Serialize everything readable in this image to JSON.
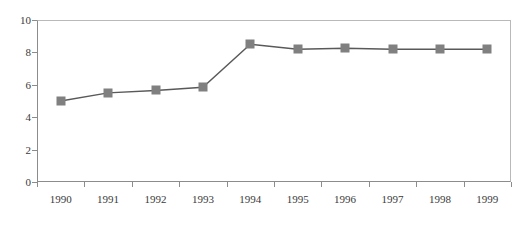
{
  "chart_data": {
    "type": "line",
    "title": "",
    "xlabel": "",
    "ylabel": "",
    "categories": [
      "1990",
      "1991",
      "1992",
      "1993",
      "1994",
      "1995",
      "1996",
      "1997",
      "1998",
      "1999"
    ],
    "values": [
      5.0,
      5.5,
      5.65,
      5.85,
      8.5,
      8.2,
      8.25,
      8.2,
      8.2,
      8.2
    ],
    "series": [
      {
        "name": "series-1",
        "values": [
          5.0,
          5.5,
          5.65,
          5.85,
          8.5,
          8.2,
          8.25,
          8.2,
          8.2,
          8.2
        ]
      }
    ],
    "ylim": [
      0,
      10
    ],
    "ytick_values": [
      0,
      2,
      4,
      6,
      8,
      10
    ],
    "ytick_labels": [
      "0",
      "2",
      "4",
      "6",
      "8",
      "10"
    ],
    "grid": false,
    "legend": null,
    "marker": "square",
    "colors": {
      "series": "#808080",
      "line": "#595959",
      "axis": "#8c8c8c",
      "plot_border": "#b9b9b9",
      "tick_text": "#3a3a3a",
      "background": "#ffffff"
    }
  },
  "caption": ""
}
